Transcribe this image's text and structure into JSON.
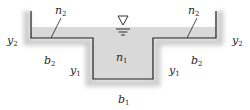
{
  "diagram": {
    "colors": {
      "line": "#1e1e1e",
      "water": "#d9d9d9",
      "shadow": "#c4c4c4",
      "text": "#2a2a2a"
    },
    "labels": {
      "n2_left": {
        "sym": "n",
        "sub": "2"
      },
      "n2_right": {
        "sym": "n",
        "sub": "2"
      },
      "n1": {
        "sym": "n",
        "sub": "1"
      },
      "y2_left": {
        "sym": "y",
        "sub": "2"
      },
      "y2_right": {
        "sym": "y",
        "sub": "2"
      },
      "y1_left": {
        "sym": "y",
        "sub": "1"
      },
      "y1_right": {
        "sym": "y",
        "sub": "1"
      },
      "b2_left": {
        "sym": "b",
        "sub": "2"
      },
      "b2_right": {
        "sym": "b",
        "sub": "2"
      },
      "b1": {
        "sym": "b",
        "sub": "1"
      }
    },
    "water_surface_symbol": "free-surface-triangle"
  }
}
